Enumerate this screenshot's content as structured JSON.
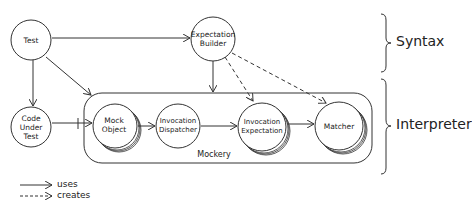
{
  "diagram": {
    "nodes": [
      {
        "id": "test",
        "lines": [
          "Test"
        ]
      },
      {
        "id": "expectation-builder",
        "lines": [
          "Expectation",
          "Builder"
        ]
      },
      {
        "id": "code-under-test",
        "lines": [
          "Code",
          "Under",
          "Test"
        ]
      },
      {
        "id": "mock-object",
        "lines": [
          "Mock",
          "Object"
        ]
      },
      {
        "id": "invocation-dispatcher",
        "lines": [
          "Invocation",
          "Dispatcher"
        ]
      },
      {
        "id": "invocation-expectation",
        "lines": [
          "Invocation",
          "Expectation"
        ]
      },
      {
        "id": "matcher",
        "lines": [
          "Matcher"
        ]
      }
    ],
    "container": {
      "label": "Mockery"
    },
    "edges": [
      {
        "from": "test",
        "to": "expectation-builder",
        "type": "uses"
      },
      {
        "from": "test",
        "to": "code-under-test",
        "type": "uses"
      },
      {
        "from": "test",
        "to": "mockery",
        "type": "uses"
      },
      {
        "from": "expectation-builder",
        "to": "mockery",
        "type": "uses"
      },
      {
        "from": "expectation-builder",
        "to": "invocation-expectation",
        "type": "creates"
      },
      {
        "from": "expectation-builder",
        "to": "matcher",
        "type": "creates"
      },
      {
        "from": "code-under-test",
        "to": "mock-object",
        "type": "uses"
      },
      {
        "from": "mock-object",
        "to": "invocation-dispatcher",
        "type": "uses"
      },
      {
        "from": "invocation-dispatcher",
        "to": "invocation-expectation",
        "type": "uses"
      },
      {
        "from": "invocation-expectation",
        "to": "matcher",
        "type": "uses"
      }
    ],
    "groups": [
      {
        "label": "Syntax"
      },
      {
        "label": "Interpreter"
      }
    ],
    "legend": [
      {
        "style": "solid",
        "label": "uses"
      },
      {
        "style": "dashed",
        "label": "creates"
      }
    ]
  }
}
